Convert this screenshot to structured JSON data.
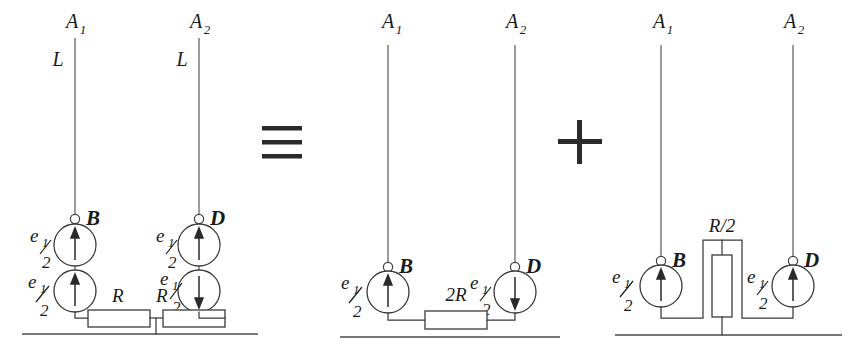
{
  "figure": {
    "kind": "circuit-equivalence-diagram",
    "width": 849,
    "height": 349,
    "background_color": "#ffffff",
    "line_color": "#3a3a3a",
    "text_color": "#1a1a1a"
  },
  "operators": {
    "identity": "≡",
    "identity_name": "identical-to",
    "plus": "+",
    "plus_name": "plus"
  },
  "circuits": [
    {
      "id": "original",
      "name": "original-network",
      "terminals": [
        {
          "label": "A",
          "subscript": "1",
          "name": "terminal-a1"
        },
        {
          "label": "A",
          "subscript": "2",
          "name": "terminal-a2"
        }
      ],
      "line_labels": [
        {
          "text": "L",
          "name": "line-inductance-left"
        },
        {
          "text": "L",
          "name": "line-inductance-right"
        }
      ],
      "nodes": [
        {
          "label": "B",
          "name": "node-b"
        },
        {
          "label": "D",
          "name": "node-d"
        }
      ],
      "sources": [
        {
          "label": "e",
          "sub_num": "1",
          "sub_den": "2",
          "direction": "up",
          "branch": "B",
          "position": "upper",
          "name": "source-b-upper"
        },
        {
          "label": "e",
          "sub_num": "1",
          "sub_den": "2",
          "direction": "up",
          "branch": "B",
          "position": "lower",
          "name": "source-b-lower"
        },
        {
          "label": "e",
          "sub_num": "1",
          "sub_den": "2",
          "direction": "up",
          "branch": "D",
          "position": "upper",
          "name": "source-d-upper"
        },
        {
          "label": "e",
          "sub_num": "1",
          "sub_den": "2",
          "direction": "down",
          "branch": "D",
          "position": "lower",
          "name": "source-d-lower"
        }
      ],
      "resistors": [
        {
          "label": "R",
          "orientation": "horizontal",
          "name": "resistor-left-r"
        },
        {
          "label": "R",
          "orientation": "horizontal",
          "name": "resistor-right-r"
        }
      ],
      "ground": {
        "name": "ground-original",
        "present": true
      }
    },
    {
      "id": "differential",
      "name": "differential-mode-network",
      "terminals": [
        {
          "label": "A",
          "subscript": "1",
          "name": "terminal-a1"
        },
        {
          "label": "A",
          "subscript": "2",
          "name": "terminal-a2"
        }
      ],
      "line_labels": [],
      "nodes": [
        {
          "label": "B",
          "name": "node-b"
        },
        {
          "label": "D",
          "name": "node-d"
        }
      ],
      "sources": [
        {
          "label": "e",
          "sub_num": "1",
          "sub_den": "2",
          "direction": "up",
          "branch": "B",
          "position": "single",
          "name": "source-b"
        },
        {
          "label": "e",
          "sub_num": "1",
          "sub_den": "2",
          "direction": "down",
          "branch": "D",
          "position": "single",
          "name": "source-d"
        }
      ],
      "resistors": [
        {
          "label": "2R",
          "orientation": "horizontal",
          "name": "resistor-2r"
        }
      ],
      "ground": {
        "name": "ground-differential",
        "present": true
      }
    },
    {
      "id": "common",
      "name": "common-mode-network",
      "terminals": [
        {
          "label": "A",
          "subscript": "1",
          "name": "terminal-a1"
        },
        {
          "label": "A",
          "subscript": "2",
          "name": "terminal-a2"
        }
      ],
      "line_labels": [],
      "nodes": [
        {
          "label": "B",
          "name": "node-b"
        },
        {
          "label": "D",
          "name": "node-d"
        }
      ],
      "sources": [
        {
          "label": "e",
          "sub_num": "1",
          "sub_den": "2",
          "direction": "up",
          "branch": "B",
          "position": "single",
          "name": "source-b"
        },
        {
          "label": "e",
          "sub_num": "1",
          "sub_den": "2",
          "direction": "up",
          "branch": "D",
          "position": "single",
          "name": "source-d"
        }
      ],
      "resistors": [
        {
          "label": "R/2",
          "orientation": "vertical",
          "name": "resistor-r-over-2"
        }
      ],
      "ground": {
        "name": "ground-common",
        "present": true
      }
    }
  ]
}
